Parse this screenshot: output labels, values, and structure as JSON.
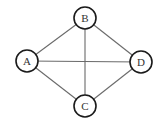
{
  "diagram": {
    "type": "undirected-graph",
    "nodes": [
      {
        "id": "A",
        "label": "A",
        "x": 27,
        "y": 61
      },
      {
        "id": "B",
        "label": "B",
        "x": 85,
        "y": 18
      },
      {
        "id": "C",
        "label": "C",
        "x": 85,
        "y": 106
      },
      {
        "id": "D",
        "label": "D",
        "x": 141,
        "y": 62
      }
    ],
    "edges": [
      [
        "A",
        "B"
      ],
      [
        "B",
        "D"
      ],
      [
        "A",
        "D"
      ],
      [
        "A",
        "C"
      ],
      [
        "C",
        "D"
      ],
      [
        "B",
        "C"
      ]
    ],
    "node_radius": 11,
    "colors": {
      "edge": "#6a6a6a",
      "node_stroke": "#1a1a1a",
      "node_fill": "#ffffff",
      "label": "#333333"
    }
  }
}
